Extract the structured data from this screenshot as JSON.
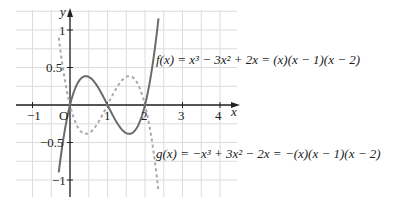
{
  "chart_data": {
    "type": "line",
    "title": "",
    "xlabel": "x",
    "ylabel": "y",
    "xlim": [
      -1.45,
      4.45
    ],
    "ylim": [
      -1.25,
      1.27
    ],
    "grid": true,
    "x_ticks": [
      "-1",
      "1",
      "2",
      "3",
      "4"
    ],
    "y_ticks": [
      "1",
      "0.5",
      "-0.5",
      "-1"
    ],
    "origin_label": "O",
    "series": [
      {
        "name": "f",
        "style": "solid",
        "color": "#6b6b6b",
        "label": "f(x) = x³ − 3x² + 2x = (x)(x − 1)(x − 2)",
        "domain": [
          -0.3,
          2.36
        ],
        "expression": "x^3 - 3x^2 + 2x"
      },
      {
        "name": "g",
        "style": "dashed",
        "color": "#a8a8a8",
        "label": "g(x) = −x³ + 3x² − 2x = −(x)(x − 1)(x − 2)",
        "domain": [
          -0.3,
          2.36
        ],
        "expression": "-x^3 + 3x^2 - 2x"
      }
    ],
    "annotations": [
      "f(x) = x³ − 3x² + 2x = (x)(x − 1)(x − 2)",
      "g(x) = −x³ + 3x² − 2x = −(x)(x − 1)(x − 2)"
    ]
  },
  "labels": {
    "x_axis": "x",
    "y_axis": "y",
    "origin": "O",
    "f_label": "f(x) = x³ − 3x² + 2x = (x)(x − 1)(x − 2)",
    "g_label": "g(x) = −x³ + 3x² − 2x = −(x)(x − 1)(x − 2)",
    "tick_x_m1": "−1",
    "tick_x_1": "1",
    "tick_x_2": "2",
    "tick_x_3": "3",
    "tick_x_4": "4",
    "tick_y_1": "1",
    "tick_y_05": "0.5",
    "tick_y_m05": "−0.5",
    "tick_y_m1": "−1"
  }
}
